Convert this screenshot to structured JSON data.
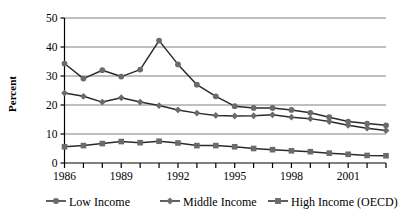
{
  "chart_data": {
    "type": "line",
    "title": "",
    "xlabel": "",
    "ylabel": "Percent",
    "xlim": [
      1986,
      2003
    ],
    "ylim": [
      0,
      50
    ],
    "yticks": [
      0,
      10,
      20,
      30,
      40,
      50
    ],
    "xticks": [
      1986,
      1987,
      1988,
      1989,
      1990,
      1991,
      1992,
      1993,
      1994,
      1995,
      1996,
      1997,
      1998,
      1999,
      2000,
      2001,
      2002,
      2003
    ],
    "xtick_labels": [
      "1986",
      "",
      "",
      "1989",
      "",
      "",
      "1992",
      "",
      "",
      "1995",
      "",
      "",
      "1998",
      "",
      "",
      "2001",
      "",
      ""
    ],
    "ytick_labels": [
      "0",
      "10",
      "20",
      "30",
      "40",
      "50"
    ],
    "grid": "horizontal",
    "legend_position": "bottom",
    "x": [
      1986,
      1987,
      1988,
      1989,
      1990,
      1991,
      1992,
      1993,
      1994,
      1995,
      1996,
      1997,
      1998,
      1999,
      2000,
      2001,
      2002,
      2003
    ],
    "series": [
      {
        "name": "Low Income",
        "marker": "circle",
        "color": "#6b6b6b",
        "line_color": "#2a2a2a",
        "values": [
          34.3,
          29.1,
          32.0,
          29.8,
          32.2,
          42.2,
          34.0,
          27.0,
          23.0,
          19.6,
          19.0,
          19.0,
          18.3,
          17.3,
          15.8,
          14.3,
          13.6,
          13.0
        ]
      },
      {
        "name": "Middle Income",
        "marker": "diamond",
        "color": "#6b6b6b",
        "line_color": "#2a2a2a",
        "values": [
          24.1,
          23.0,
          21.0,
          22.5,
          21.0,
          19.8,
          18.3,
          17.2,
          16.4,
          16.2,
          16.3,
          16.6,
          15.8,
          15.3,
          14.3,
          13.0,
          12.0,
          11.2
        ]
      },
      {
        "name": "High Income (OECD)",
        "marker": "square",
        "color": "#6b6b6b",
        "line_color": "#2a2a2a",
        "values": [
          5.6,
          6.0,
          6.7,
          7.4,
          7.0,
          7.5,
          6.9,
          6.0,
          6.0,
          5.6,
          5.0,
          4.6,
          4.2,
          3.9,
          3.4,
          3.0,
          2.6,
          2.5
        ]
      }
    ],
    "legend": [
      {
        "label": "Low Income",
        "marker": "circle"
      },
      {
        "label": "Middle Income",
        "marker": "diamond"
      },
      {
        "label": "High Income (OECD)",
        "marker": "square"
      }
    ],
    "colors": {
      "marker": "#6b6b6b",
      "line": "#2a2a2a",
      "grid": "#808080",
      "axis": "#000000",
      "background": "#ffffff"
    }
  }
}
